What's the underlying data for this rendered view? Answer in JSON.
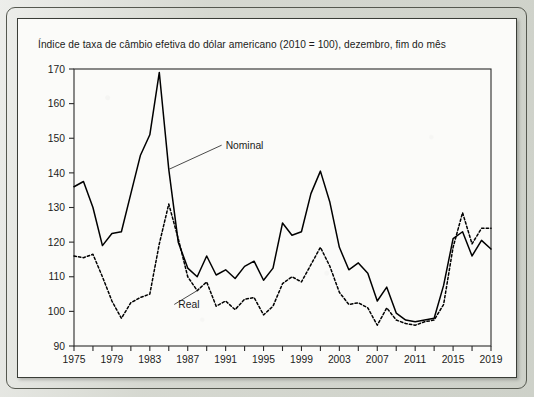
{
  "chart_data": {
    "type": "line",
    "title": "Índice de taxa de câmbio efetiva do dólar americano (2010 = 100), dezembro, fim do mês",
    "xlabel": "",
    "ylabel": "",
    "xlim": [
      1975,
      2019
    ],
    "ylim": [
      90,
      170
    ],
    "ytick_step": 10,
    "xtick_step": 4,
    "minor_xtick_step": 2,
    "grid": false,
    "legend_position": "inline-annotation",
    "yticks": [
      90,
      100,
      110,
      120,
      130,
      140,
      150,
      160,
      170
    ],
    "xticks": [
      1975,
      1979,
      1983,
      1987,
      1991,
      1995,
      1999,
      2003,
      2007,
      2011,
      2015,
      2019
    ],
    "x": [
      1975,
      1976,
      1977,
      1978,
      1979,
      1980,
      1981,
      1982,
      1983,
      1984,
      1985,
      1986,
      1987,
      1988,
      1989,
      1990,
      1991,
      1992,
      1993,
      1994,
      1995,
      1996,
      1997,
      1998,
      1999,
      2000,
      2001,
      2002,
      2003,
      2004,
      2005,
      2006,
      2007,
      2008,
      2009,
      2010,
      2011,
      2012,
      2013,
      2014,
      2015,
      2016,
      2017,
      2018,
      2019
    ],
    "series": [
      {
        "name": "Nominal",
        "style": "solid",
        "color": "#000000",
        "label_x": 1991,
        "label_y": 148,
        "values": [
          136.0,
          137.5,
          130.0,
          119.0,
          122.5,
          123.0,
          134.0,
          145.0,
          151.0,
          169.0,
          141.0,
          120.0,
          112.5,
          110.0,
          116.0,
          110.5,
          112.0,
          109.5,
          113.0,
          114.5,
          109.0,
          112.5,
          125.5,
          122.0,
          123.0,
          134.0,
          140.5,
          131.5,
          118.5,
          112.0,
          114.0,
          111.0,
          103.0,
          107.0,
          99.5,
          97.5,
          97.0,
          97.5,
          98.0,
          107.5,
          121.0,
          123.0,
          116.0,
          120.5,
          118.0
        ]
      },
      {
        "name": "Real",
        "style": "dashed",
        "color": "#000000",
        "label_x": 1986,
        "label_y": 102,
        "values": [
          116.0,
          115.5,
          116.5,
          110.0,
          103.0,
          98.0,
          102.5,
          104.0,
          105.0,
          119.5,
          131.0,
          121.0,
          110.0,
          106.0,
          108.5,
          101.5,
          103.0,
          100.5,
          103.5,
          104.0,
          99.0,
          101.5,
          108.0,
          110.0,
          108.5,
          113.5,
          118.5,
          113.0,
          105.5,
          102.0,
          102.5,
          101.0,
          96.0,
          101.0,
          97.5,
          96.5,
          96.0,
          97.0,
          97.5,
          102.0,
          118.5,
          128.5,
          119.5,
          124.0,
          124.0
        ]
      }
    ]
  },
  "figure": {
    "panel_label": ""
  }
}
